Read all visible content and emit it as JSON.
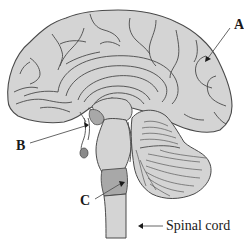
{
  "figure": {
    "labels": [
      {
        "id": "A",
        "text": "A",
        "points_to": "cerebrum (parietal/occipital cortex)"
      },
      {
        "id": "B",
        "text": "B",
        "points_to": "pituitary / hypothalamus region"
      },
      {
        "id": "C",
        "text": "C",
        "points_to": "medulla oblongata"
      },
      {
        "id": "spinal",
        "text": "Spinal cord",
        "points_to": "spinal cord"
      }
    ],
    "colors": {
      "tissue": "#d4d4d4",
      "outline": "#4a4a4a",
      "highlight": "#a8a8a8",
      "pituitary": "#8a8a8a",
      "text": "#1a1a1a",
      "background": "#ffffff"
    }
  }
}
